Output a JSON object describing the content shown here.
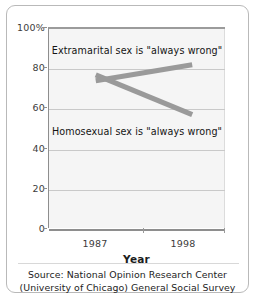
{
  "chart_data": {
    "type": "line",
    "title": "",
    "xlabel": "Year",
    "ylabel": "",
    "x": [
      1987,
      1998
    ],
    "categories": [
      "1987",
      "1998"
    ],
    "xtick_labels": [
      "1987",
      "1998"
    ],
    "ytick_labels": [
      "100%",
      "80",
      "60",
      "40",
      "20",
      "0"
    ],
    "ytick_values": [
      100,
      80,
      60,
      40,
      20,
      0
    ],
    "ylim": [
      0,
      100
    ],
    "grid": true,
    "legend": "none",
    "series": [
      {
        "name": "Extramarital sex is \"always wrong\"",
        "values": [
          74,
          82
        ],
        "color": "#9a9a9a"
      },
      {
        "name": "Homosexual sex is \"always wrong\"",
        "values": [
          77,
          57
        ],
        "color": "#9a9a9a"
      }
    ],
    "annotations": [
      {
        "text": "Extramarital sex is \"always wrong\"",
        "series": 0
      },
      {
        "text": "Homosexual sex is \"always wrong\"",
        "series": 1
      }
    ]
  },
  "axes": {
    "x_title": "Year",
    "y_ticks": [
      {
        "label": "100%",
        "value": 100
      },
      {
        "label": "80",
        "value": 80
      },
      {
        "label": "60",
        "value": 60
      },
      {
        "label": "40",
        "value": 40
      },
      {
        "label": "20",
        "value": 20
      },
      {
        "label": "0",
        "value": 0
      }
    ],
    "x_ticks": [
      {
        "label": "1987",
        "value": 1987
      },
      {
        "label": "1998",
        "value": 1998
      }
    ]
  },
  "source": {
    "line1": "Source: National Opinion Research Center",
    "line2": "(University of Chicago) General Social Survey"
  },
  "colors": {
    "line": "#9a9a9a",
    "plot_background": "#f5f5f5",
    "gridline": "#c9c9c9",
    "axis": "#8e8e8e",
    "border": "#b9b9b9",
    "text": "#1d1d1d"
  }
}
